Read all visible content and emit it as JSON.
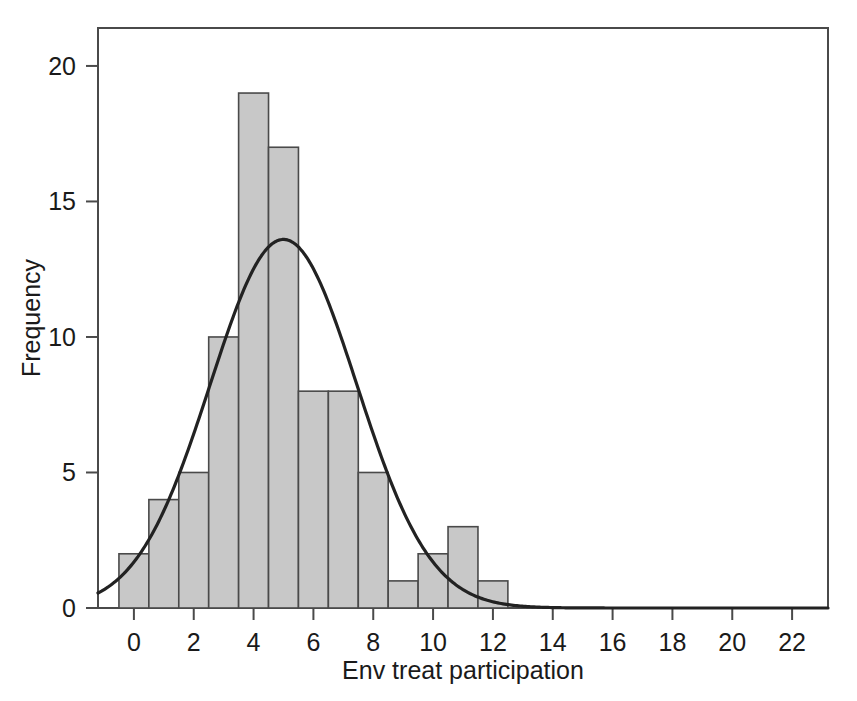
{
  "chart_data": {
    "type": "bar",
    "title": "",
    "subtitle": "",
    "xlabel": "Env treat participation",
    "ylabel": "Frequency",
    "xlim": [
      -1.2,
      23.2
    ],
    "ylim": [
      0,
      21.4
    ],
    "grid": false,
    "legend": null,
    "bin_width": 1,
    "categories": [
      "-0.5 to 0.5",
      "0.5 to 1.5",
      "1.5 to 2.5",
      "2.5 to 3.5",
      "3.5 to 4.5",
      "4.5 to 5.5",
      "5.5 to 6.5",
      "6.5 to 7.5",
      "7.5 to 8.5",
      "8.5 to 9.5",
      "9.5 to 10.5",
      "10.5 to 11.5",
      "11.5 to 12.5"
    ],
    "bin_starts": [
      -0.5,
      0.5,
      1.5,
      2.5,
      3.5,
      4.5,
      5.5,
      6.5,
      7.5,
      8.5,
      9.5,
      10.5,
      11.5
    ],
    "values": [
      2,
      4,
      5,
      10,
      19,
      17,
      8,
      8,
      5,
      1,
      2,
      3,
      1
    ],
    "x_ticks": [
      0,
      2,
      4,
      6,
      8,
      10,
      12,
      14,
      16,
      18,
      20,
      22
    ],
    "x_tick_labels": [
      "0",
      "2",
      "4",
      "6",
      "8",
      "10",
      "12",
      "14",
      "16",
      "18",
      "20",
      "22"
    ],
    "y_ticks": [
      0,
      5,
      10,
      15,
      20
    ],
    "y_tick_labels": [
      "0",
      "5",
      "10",
      "15",
      "20"
    ],
    "overlay": {
      "type": "line",
      "name": "normal curve",
      "mean": 5.0,
      "std_dev": 2.45,
      "peak_value": 13.6,
      "peak_x": 5.0,
      "n": 86
    }
  },
  "axes": {
    "x_title": "Env treat participation",
    "y_title": "Frequency"
  },
  "colors": {
    "bar_fill": "#c8c8c8",
    "bar_stroke": "#4a4a4a",
    "curve": "#222222",
    "axis": "#4a4a4a",
    "text": "#1a1a1a",
    "background": "#ffffff"
  }
}
